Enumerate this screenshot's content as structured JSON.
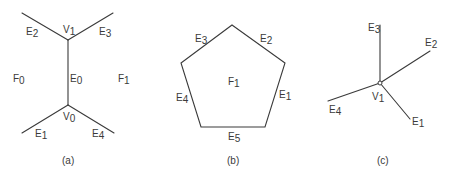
{
  "figure": {
    "panels": [
      {
        "id": "a",
        "caption": "(a)",
        "description": "Edge E0 between vertices V1 and V0 separating faces F0 and F1",
        "vertices": [
          {
            "name": "V",
            "sub": "1"
          },
          {
            "name": "V",
            "sub": "0"
          }
        ],
        "edges": [
          {
            "name": "E",
            "sub": "2"
          },
          {
            "name": "E",
            "sub": "3"
          },
          {
            "name": "E",
            "sub": "0"
          },
          {
            "name": "E",
            "sub": "1"
          },
          {
            "name": "E",
            "sub": "4"
          }
        ],
        "faces": [
          {
            "name": "F",
            "sub": "0"
          },
          {
            "name": "F",
            "sub": "1"
          }
        ]
      },
      {
        "id": "b",
        "caption": "(b)",
        "description": "Pentagonal face F1 bounded by edges E1–E5",
        "faces": [
          {
            "name": "F",
            "sub": "1"
          }
        ],
        "edges": [
          {
            "name": "E",
            "sub": "3"
          },
          {
            "name": "E",
            "sub": "2"
          },
          {
            "name": "E",
            "sub": "1"
          },
          {
            "name": "E",
            "sub": "4"
          },
          {
            "name": "E",
            "sub": "5"
          }
        ]
      },
      {
        "id": "c",
        "caption": "(c)",
        "description": "Vertex V1 with incident edges E1–E4",
        "vertices": [
          {
            "name": "V",
            "sub": "1"
          }
        ],
        "edges": [
          {
            "name": "E",
            "sub": "3"
          },
          {
            "name": "E",
            "sub": "2"
          },
          {
            "name": "E",
            "sub": "4"
          },
          {
            "name": "E",
            "sub": "1"
          }
        ]
      }
    ]
  }
}
